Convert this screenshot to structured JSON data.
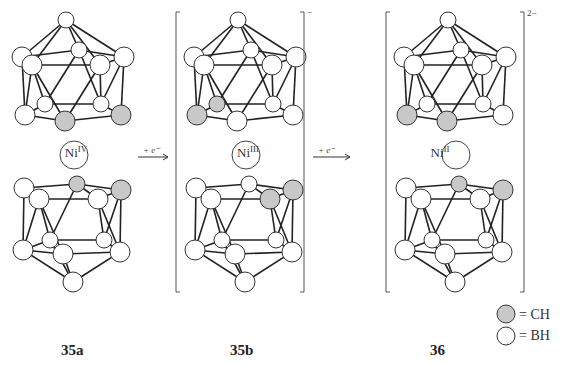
{
  "figure": {
    "compounds": [
      {
        "id": "35a",
        "label": "35a",
        "metal": "Ni",
        "oxidation": "IV",
        "charge": ""
      },
      {
        "id": "35b",
        "label": "35b",
        "metal": "Ni",
        "oxidation": "III",
        "charge": "−"
      },
      {
        "id": "36",
        "label": "36",
        "metal": "Ni",
        "oxidation": "II",
        "charge": "2−"
      }
    ],
    "arrows": [
      {
        "label": "+ e⁻"
      },
      {
        "label": "+ e⁻"
      }
    ],
    "legend": [
      {
        "symbol": "grey-circle",
        "text": "= CH",
        "color": "#c8c8c8"
      },
      {
        "symbol": "white-circle",
        "text": "= BH",
        "color": "#ffffff"
      }
    ],
    "colors": {
      "ch": "#c8c8c8",
      "bh": "#ffffff",
      "line": "#222222",
      "bracket": "#555555"
    }
  },
  "geometry": {
    "top": {
      "nodes": [
        [
          66,
          20,
          8
        ],
        [
          22,
          57,
          10
        ],
        [
          79,
          50,
          8
        ],
        [
          124,
          57,
          10
        ],
        [
          32,
          65,
          10
        ],
        [
          100,
          65,
          10
        ],
        [
          45,
          104,
          8
        ],
        [
          101,
          104,
          8
        ],
        [
          25,
          115,
          10
        ],
        [
          65,
          121,
          10
        ],
        [
          121,
          115,
          10
        ]
      ],
      "edges": [
        [
          0,
          1
        ],
        [
          0,
          2
        ],
        [
          0,
          3
        ],
        [
          0,
          4
        ],
        [
          0,
          5
        ],
        [
          1,
          2
        ],
        [
          2,
          3
        ],
        [
          1,
          4
        ],
        [
          4,
          5
        ],
        [
          5,
          3
        ],
        [
          1,
          8
        ],
        [
          4,
          8
        ],
        [
          4,
          6
        ],
        [
          4,
          9
        ],
        [
          2,
          6
        ],
        [
          2,
          7
        ],
        [
          5,
          7
        ],
        [
          5,
          9
        ],
        [
          3,
          10
        ],
        [
          3,
          7
        ],
        [
          8,
          6
        ],
        [
          6,
          7
        ],
        [
          7,
          10
        ],
        [
          8,
          9
        ],
        [
          9,
          10
        ]
      ]
    },
    "bottom": {
      "nodes": [
        [
          24,
          188,
          10
        ],
        [
          77,
          184,
          8
        ],
        [
          121,
          190,
          10
        ],
        [
          39,
          199,
          10
        ],
        [
          98,
          199,
          10
        ],
        [
          50,
          240,
          8
        ],
        [
          104,
          240,
          8
        ],
        [
          23,
          250,
          10
        ],
        [
          63,
          254,
          10
        ],
        [
          120,
          252,
          10
        ],
        [
          73,
          282,
          10
        ]
      ],
      "edges": [
        [
          0,
          1
        ],
        [
          1,
          2
        ],
        [
          0,
          3
        ],
        [
          3,
          4
        ],
        [
          4,
          2
        ],
        [
          0,
          7
        ],
        [
          3,
          7
        ],
        [
          3,
          5
        ],
        [
          3,
          8
        ],
        [
          1,
          5
        ],
        [
          1,
          4
        ],
        [
          4,
          6
        ],
        [
          4,
          9
        ],
        [
          2,
          9
        ],
        [
          2,
          6
        ],
        [
          7,
          5
        ],
        [
          5,
          6
        ],
        [
          6,
          9
        ],
        [
          7,
          8
        ],
        [
          8,
          9
        ],
        [
          7,
          10
        ],
        [
          8,
          10
        ],
        [
          9,
          10
        ],
        [
          5,
          10
        ]
      ]
    },
    "ch_top": {
      "35a": [
        9,
        10
      ],
      "35b": [
        8,
        6
      ],
      "36": [
        8,
        9
      ]
    },
    "ch_bottom": {
      "35a": [
        1,
        2
      ],
      "35b": [
        4,
        2
      ],
      "36": [
        1,
        2
      ]
    },
    "offsets_x": {
      "35a": 0,
      "35b": 172,
      "36": 382
    },
    "ni_center_y": 155
  }
}
